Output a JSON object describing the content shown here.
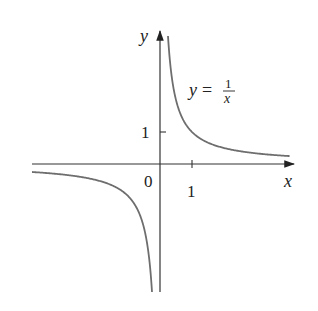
{
  "chart_data": {
    "type": "line",
    "title": "",
    "function_label": "y = 1/x",
    "equation": {
      "lhs": "y",
      "eq": "=",
      "num": "1",
      "den": "x"
    },
    "xlabel": "x",
    "ylabel": "y",
    "origin_label": "0",
    "x_ticks": [
      {
        "value": 1,
        "label": "1"
      }
    ],
    "y_ticks": [
      {
        "value": 1,
        "label": "1"
      }
    ],
    "xlim": [
      -4,
      4.2
    ],
    "ylim": [
      -4,
      4.1
    ],
    "grid": false,
    "legend": null,
    "series": [
      {
        "name": "y = 1/x (x > 0)",
        "x": [
          0.25,
          0.3,
          0.4,
          0.5,
          0.75,
          1,
          1.5,
          2,
          3,
          4.05
        ],
        "y": [
          4,
          3.33,
          2.5,
          2,
          1.33,
          1,
          0.67,
          0.5,
          0.33,
          0.25
        ]
      },
      {
        "name": "y = 1/x (x < 0)",
        "x": [
          -4,
          -3,
          -2,
          -1.5,
          -1,
          -0.75,
          -0.5,
          -0.4,
          -0.3,
          -0.25
        ],
        "y": [
          -0.25,
          -0.33,
          -0.5,
          -0.67,
          -1,
          -1.33,
          -2,
          -2.5,
          -3.33,
          -4
        ]
      }
    ],
    "colors": {
      "curve": "#6e6e6e",
      "axes": "#333333"
    }
  }
}
